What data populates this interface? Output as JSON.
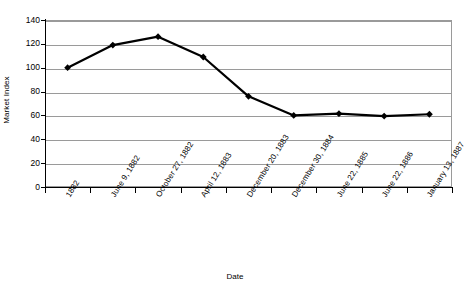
{
  "chart_data": {
    "type": "line",
    "title": "",
    "xlabel": "Date",
    "ylabel": "Market Index",
    "categories": [
      "1882",
      "June 9, 1882",
      "October 27, 1882",
      "April 12, 1883",
      "December 20, 1883",
      "December 30, 1884",
      "June 22, 1885",
      "June 22, 1886",
      "January 13, 1887"
    ],
    "values": [
      100,
      119,
      126,
      109,
      76,
      60,
      61.5,
      59.5,
      61
    ],
    "ylim": [
      0,
      140
    ],
    "ytick_labels": [
      "0",
      "20",
      "40",
      "60",
      "80",
      "100",
      "120",
      "140"
    ],
    "ytick_values": [
      0,
      20,
      40,
      60,
      80,
      100,
      120,
      140
    ],
    "grid": true,
    "legend": false,
    "legend_position": "none",
    "series_color": "#000000",
    "marker": "diamond",
    "gridline_color": "#9a9a9a",
    "background_color": "#ffffff"
  }
}
